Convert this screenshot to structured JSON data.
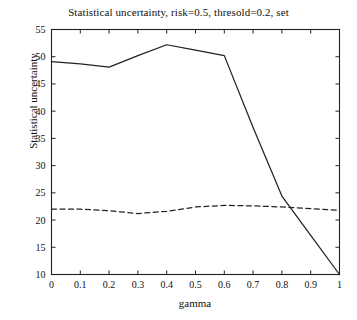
{
  "chart_data": {
    "type": "line",
    "title": "Statistical uncertainty, risk=0.5, thresold=0.2, set",
    "xlabel": "gamma",
    "ylabel": "Statistical uncertainty",
    "xlim": [
      0,
      1
    ],
    "ylim": [
      10,
      55
    ],
    "xticks": [
      "0",
      "0.1",
      "0.2",
      "0.3",
      "0.4",
      "0.5",
      "0.6",
      "0.7",
      "0.8",
      "0.9",
      "1"
    ],
    "xtick_values": [
      0,
      0.1,
      0.2,
      0.3,
      0.4,
      0.5,
      0.6,
      0.7,
      0.8,
      0.9,
      1
    ],
    "yticks": [
      "10",
      "15",
      "20",
      "25",
      "30",
      "35",
      "40",
      "45",
      "50",
      "55"
    ],
    "ytick_values": [
      10,
      15,
      20,
      25,
      30,
      35,
      40,
      45,
      50,
      55
    ],
    "grid": false,
    "legend": "none",
    "x": [
      0,
      0.1,
      0.2,
      0.3,
      0.4,
      0.5,
      0.6,
      0.7,
      0.8,
      0.9,
      1
    ],
    "series": [
      {
        "name": "solid-curve",
        "style": "solid",
        "color": "#222222",
        "values": [
          49.1,
          48.7,
          48.1,
          50.2,
          52.2,
          51.2,
          50.2,
          37.0,
          24.4,
          17.2,
          10.0
        ]
      },
      {
        "name": "dashed-curve",
        "style": "dashed",
        "color": "#222222",
        "values": [
          22.0,
          22.0,
          21.7,
          21.2,
          21.6,
          22.4,
          22.7,
          22.6,
          22.4,
          22.1,
          21.8
        ]
      }
    ]
  },
  "axis": {
    "title_text": "Statistical uncertainty, risk=0.5, thresold=0.2, set",
    "x_label_text": "gamma",
    "y_label_text": "Statistical uncertainty"
  },
  "colors": {
    "background": "#ffffff",
    "axis": "#222222",
    "solid_line": "#222222",
    "dashed_line": "#222222"
  }
}
